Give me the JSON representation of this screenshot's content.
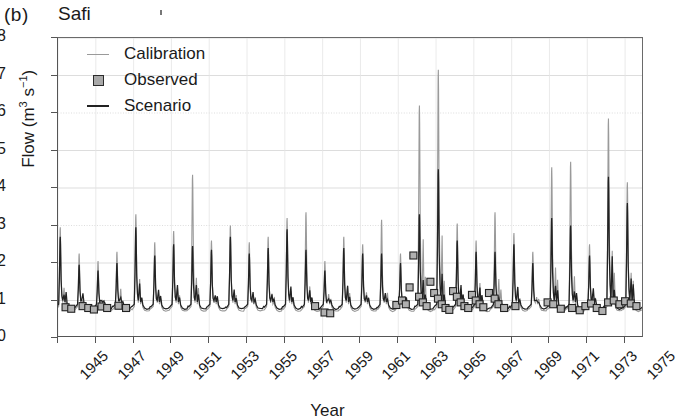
{
  "panel": {
    "label": "(b)",
    "title": "Safi"
  },
  "axes": {
    "ylabel_main": "Flow (m",
    "ylabel_sup1": "3",
    "ylabel_mid": " s",
    "ylabel_sup2": "−1",
    "ylabel_end": ")",
    "ylabel_full": "Flow (m3 s-1)",
    "xlabel": "Year",
    "yticks": [
      0,
      1,
      2,
      3,
      4,
      5,
      6,
      7,
      8
    ],
    "xticks": [
      1945,
      1947,
      1949,
      1951,
      1953,
      1955,
      1957,
      1959,
      1961,
      1963,
      1965,
      1967,
      1969,
      1971,
      1973,
      1975
    ]
  },
  "legend": {
    "items": [
      {
        "label": "Calibration",
        "key": "line-gray",
        "color": "#9a9a9a"
      },
      {
        "label": "Observed",
        "key": "square-marker",
        "color": "#a9a9a9"
      },
      {
        "label": "Scenario",
        "key": "line-black",
        "color": "#222222"
      }
    ]
  },
  "chart_data": {
    "type": "line",
    "title": "Safi",
    "xlabel": "Year",
    "ylabel": "Flow (m3 s-1)",
    "xlim": [
      1945,
      1976
    ],
    "ylim": [
      0,
      8
    ],
    "grid": "horizontal-gridlines-at-integers",
    "legend_position": "upper-left-inside",
    "series": [
      {
        "name": "Calibration",
        "color": "#9a9a9a",
        "style": "line",
        "note": "Monthly-resolution simulated hydrograph, calibration run; sharp annual winter peaks over a low summer baseflow near 0.7",
        "annual_peaks": {
          "1945": 2.95,
          "1946": 2.25,
          "1947": 2.05,
          "1948": 2.3,
          "1949": 3.3,
          "1950": 2.55,
          "1951": 2.85,
          "1952": 4.35,
          "1953": 2.6,
          "1954": 3.0,
          "1955": 2.55,
          "1956": 2.7,
          "1957": 3.2,
          "1958": 3.35,
          "1959": 2.05,
          "1960": 2.7,
          "1961": 2.5,
          "1962": 3.15,
          "1963": 2.25,
          "1964": 6.2,
          "1965": 7.15,
          "1966": 3.05,
          "1967": 2.6,
          "1968": 3.35,
          "1969": 2.8,
          "1970": 2.3,
          "1971": 4.55,
          "1972": 4.7,
          "1973": 2.5,
          "1974": 5.85,
          "1975": 4.15
        },
        "baseflow": 0.72
      },
      {
        "name": "Scenario",
        "color": "#222222",
        "style": "line",
        "note": "Scenario run; peaks generally lower than calibration, same seasonal timing",
        "annual_peaks": {
          "1945": 2.7,
          "1946": 1.95,
          "1947": 1.8,
          "1948": 2.0,
          "1949": 2.95,
          "1950": 2.2,
          "1951": 2.5,
          "1952": 2.45,
          "1953": 2.35,
          "1954": 2.7,
          "1955": 2.25,
          "1956": 2.4,
          "1957": 2.9,
          "1958": 2.35,
          "1959": 1.8,
          "1960": 2.4,
          "1961": 2.25,
          "1962": 2.25,
          "1963": 2.0,
          "1964": 3.3,
          "1965": 4.5,
          "1966": 2.6,
          "1967": 2.3,
          "1968": 2.3,
          "1969": 2.5,
          "1970": 2.0,
          "1971": 3.2,
          "1972": 3.0,
          "1973": 2.2,
          "1974": 4.3,
          "1975": 3.6
        },
        "baseflow": 0.78
      },
      {
        "name": "Observed",
        "color": "#a9a9a9",
        "style": "square-markers",
        "note": "Sparse observed monthly flows; dense cluster 1963-1968 and 1971-1975, isolated points in 1945-1950 and 1958-1961",
        "points": [
          {
            "x": 1945.4,
            "y": 0.82
          },
          {
            "x": 1945.7,
            "y": 0.78
          },
          {
            "x": 1946.3,
            "y": 0.85
          },
          {
            "x": 1946.6,
            "y": 0.8
          },
          {
            "x": 1946.9,
            "y": 0.76
          },
          {
            "x": 1947.3,
            "y": 0.84
          },
          {
            "x": 1947.6,
            "y": 0.8
          },
          {
            "x": 1948.2,
            "y": 0.86
          },
          {
            "x": 1948.6,
            "y": 0.8
          },
          {
            "x": 1958.6,
            "y": 0.85
          },
          {
            "x": 1959.1,
            "y": 0.68
          },
          {
            "x": 1959.4,
            "y": 0.66
          },
          {
            "x": 1962.9,
            "y": 0.88
          },
          {
            "x": 1963.2,
            "y": 1.0
          },
          {
            "x": 1963.4,
            "y": 0.9
          },
          {
            "x": 1963.6,
            "y": 1.35
          },
          {
            "x": 1963.8,
            "y": 2.2
          },
          {
            "x": 1964.1,
            "y": 1.1
          },
          {
            "x": 1964.3,
            "y": 0.95
          },
          {
            "x": 1964.5,
            "y": 0.85
          },
          {
            "x": 1964.7,
            "y": 1.5
          },
          {
            "x": 1964.9,
            "y": 1.2
          },
          {
            "x": 1965.1,
            "y": 1.05
          },
          {
            "x": 1965.3,
            "y": 0.9
          },
          {
            "x": 1965.5,
            "y": 0.8
          },
          {
            "x": 1965.7,
            "y": 0.75
          },
          {
            "x": 1965.9,
            "y": 1.25
          },
          {
            "x": 1966.1,
            "y": 1.1
          },
          {
            "x": 1966.3,
            "y": 0.95
          },
          {
            "x": 1966.5,
            "y": 0.85
          },
          {
            "x": 1966.7,
            "y": 0.8
          },
          {
            "x": 1966.9,
            "y": 1.15
          },
          {
            "x": 1967.1,
            "y": 1.0
          },
          {
            "x": 1967.3,
            "y": 0.9
          },
          {
            "x": 1967.5,
            "y": 0.82
          },
          {
            "x": 1967.8,
            "y": 1.2
          },
          {
            "x": 1968.1,
            "y": 1.05
          },
          {
            "x": 1968.3,
            "y": 0.9
          },
          {
            "x": 1968.6,
            "y": 0.8
          },
          {
            "x": 1969.2,
            "y": 0.85
          },
          {
            "x": 1970.9,
            "y": 0.95
          },
          {
            "x": 1971.2,
            "y": 0.9
          },
          {
            "x": 1971.6,
            "y": 0.78
          },
          {
            "x": 1972.2,
            "y": 0.8
          },
          {
            "x": 1972.6,
            "y": 0.74
          },
          {
            "x": 1972.9,
            "y": 0.85
          },
          {
            "x": 1973.2,
            "y": 0.92
          },
          {
            "x": 1973.5,
            "y": 0.8
          },
          {
            "x": 1973.8,
            "y": 0.72
          },
          {
            "x": 1974.1,
            "y": 0.95
          },
          {
            "x": 1974.4,
            "y": 1.0
          },
          {
            "x": 1974.7,
            "y": 0.9
          },
          {
            "x": 1975.0,
            "y": 0.98
          },
          {
            "x": 1975.3,
            "y": 0.92
          },
          {
            "x": 1975.6,
            "y": 0.85
          }
        ]
      }
    ]
  }
}
